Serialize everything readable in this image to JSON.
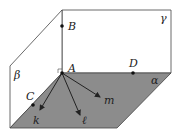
{
  "diagram": {
    "planes": {
      "alpha": "α",
      "beta": "β",
      "gamma": "γ"
    },
    "points": {
      "A": "A",
      "B": "B",
      "C": "C",
      "D": "D"
    },
    "vectors": {
      "k": "k",
      "l": "ℓ",
      "m": "m"
    },
    "colors": {
      "plane_alpha_fill": "#8c8c8c",
      "line": "#333333",
      "background": "#ffffff"
    }
  }
}
